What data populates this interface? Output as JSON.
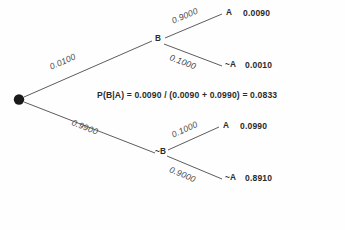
{
  "diagram": {
    "type": "probability-tree",
    "root": {
      "label": "",
      "x": 19,
      "y": 99
    },
    "nodes": {
      "b": "B",
      "not_b": "~B"
    },
    "branch_probabilities": {
      "root_to_b": "0.0100",
      "root_to_not_b": "0.9900",
      "b_to_a": "0.9000",
      "b_to_not_a": "0.1000",
      "not_b_to_a": "0.1000",
      "not_b_to_not_a": "0.9000"
    },
    "leaves": [
      {
        "name": "A",
        "value": "0.0090"
      },
      {
        "name": "~A",
        "value": "0.0010"
      },
      {
        "name": "A",
        "value": "0.0990"
      },
      {
        "name": "~A",
        "value": "0.8910"
      }
    ],
    "formula": "P(B|A) = 0.0090 / (0.0090 + 0.0990) = 0.0833",
    "colors": {
      "background": "#fefefe",
      "line": "#4a4a4a",
      "node": "#1a1a1a",
      "text": "#2b2b2b"
    }
  }
}
